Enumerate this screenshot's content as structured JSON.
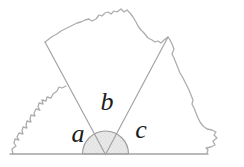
{
  "figure": {
    "labels": {
      "angle_a": "a",
      "angle_b": "b",
      "angle_c": "c"
    },
    "colors": {
      "background": "#ffffff",
      "map_outline": "#aeaeae",
      "rays": "#a4a4a4",
      "baseline": "#a4a4a4",
      "semicircle_fill": "#e9e9e9",
      "semicircle_stipple": "#cfcfcf",
      "semicircle_stroke": "#9c9c9c",
      "label_text": "#1c1c1c"
    },
    "geometry": {
      "viewbox": "0 0 244 167",
      "vertex": "105.5,154.5",
      "baseline_path": "M10,154 L208,154",
      "left_ray_path": "M45,42 L105.5,154.5",
      "right_ray_path": "M168,37 L105.5,154.5",
      "semicircle_path": "M82.5,154 A23,23 0 0 1 128.5,154 Z",
      "outline_west_path": "M66,86 L62,88 59,87 57,91 53,94 51,98 47,97 46,101 42,100 43,104 39,103 38,107 40,110 36,109 34,113 35,116 31,115 30,119 31,122 27,121 26,125 27,128 23,127 22,131 23,134 19,133 17,137 19,140 15,139 14,143 16,146 12,149 13,154",
      "outline_east_top_path": "M207,153 L208,150 206,148 211,147 215,145 213,141 217,138 214,135 216,132 212,130 207,129 203,126 200,122 198,118 196,113 194,108 192,104 193,100 191,95 189,90 186,84 183,78 180,73 178,68 176,63 174,58 172,54 174,49 172,44 170,40 168,37 164,40 161,43 158,41 155,42 152,40 148,38 144,33 141,30 138,26 136,22 133,17 130,13 127,10 124,12 121,9 117,12 114,11 111,14 108,12 105,13 102,16 99,15 96,19 92,21 89,19 85,20 81,22 77,23 73,25 69,27 65,29 61,31 57,34 53,36 49,39 45,42"
    }
  }
}
